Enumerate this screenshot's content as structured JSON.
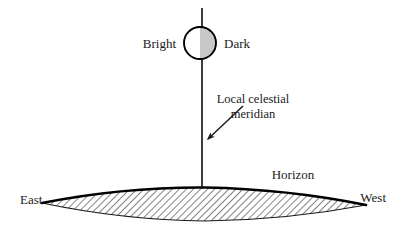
{
  "figure": {
    "type": "astronomy-diagram",
    "background_color": "#ffffff",
    "line_color": "#000000",
    "shade_color": "#c8c8c8"
  },
  "labels": {
    "bright": "Bright",
    "dark": "Dark",
    "meridian_line1": "Local celestial",
    "meridian_line2": "meridian",
    "horizon": "Horizon",
    "east": "East",
    "west": "West"
  },
  "elements": {
    "moon": {
      "name": "moon-circle",
      "center_x": 200,
      "center_y": 43,
      "radius": 16,
      "bright_half": "left",
      "dark_half": "right"
    },
    "meridian": {
      "name": "meridian-line",
      "x": 202,
      "y_top": 8,
      "y_bottom": 189
    },
    "arrow": {
      "name": "meridian-pointer-arrow",
      "from_x": 243,
      "from_y": 106,
      "to_x": 206,
      "to_y": 141
    },
    "horizon": {
      "name": "horizon-curve",
      "left_x": 42,
      "left_y": 203,
      "apex_x": 205,
      "apex_y": 187,
      "right_x": 366,
      "right_y": 205,
      "hatched": true,
      "hatch_angle_deg": 45
    }
  }
}
